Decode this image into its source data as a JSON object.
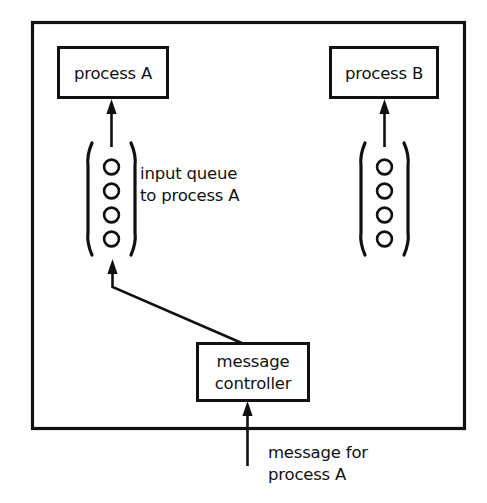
{
  "diagram": {
    "colors": {
      "stroke": "#111111",
      "background": "#ffffff",
      "fill": "#ffffff"
    },
    "nodes": {
      "process_a": {
        "label": "process A",
        "shape": "rectangle"
      },
      "process_b": {
        "label": "process B",
        "shape": "rectangle"
      },
      "message_controller": {
        "label_line1": "message",
        "label_line2": "controller",
        "shape": "rectangle"
      },
      "queue_a": {
        "shape": "queue",
        "slot_count": 4,
        "slot_shape": "circle"
      },
      "queue_b": {
        "shape": "queue",
        "slot_count": 4,
        "slot_shape": "circle"
      }
    },
    "annotations": {
      "queue_a_label_line1": "input queue",
      "queue_a_label_line2": "to process A",
      "incoming_message_line1": "message for",
      "incoming_message_line2": "process A"
    },
    "edges": [
      {
        "name": "queue-a-to-process-a",
        "from": "queue_a",
        "to": "process_a",
        "style": "arrow-up"
      },
      {
        "name": "queue-b-to-process-b",
        "from": "queue_b",
        "to": "process_b",
        "style": "arrow-up"
      },
      {
        "name": "controller-to-queue-a",
        "from": "message_controller",
        "to": "queue_a",
        "style": "polyline-arrow"
      },
      {
        "name": "incoming-message-to-controller",
        "from": "incoming_message",
        "to": "message_controller",
        "style": "arrow-up"
      }
    ]
  }
}
